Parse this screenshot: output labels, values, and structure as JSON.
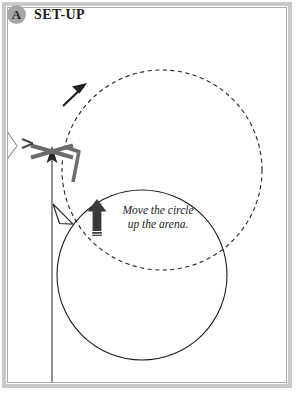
{
  "header": {
    "badge_label": "A",
    "title": "SET-UP"
  },
  "annotation": {
    "text": "Move the circle\nup the arena."
  },
  "colors": {
    "frame_outer": "#c9c9c9",
    "frame_inner": "#a9a9a9",
    "badge_fill": "#a6a6a6",
    "ink": "#1c1c1c",
    "jump_gray": "#6e6e6e",
    "arrow_dark": "#3a3a3a",
    "circle_line": "#1a1a1a",
    "background": "#ffffff"
  },
  "diagram": {
    "type": "arena-schooling-diagram",
    "elements": [
      {
        "name": "dashed-circle",
        "role": "target-circle-new-position",
        "style": "dashed",
        "center_x": 162,
        "center_y": 170,
        "radius": 100
      },
      {
        "name": "solid-circle",
        "role": "current-circle-position",
        "style": "solid",
        "center_x": 142,
        "center_y": 275,
        "radius": 85
      },
      {
        "name": "crossrail-jump",
        "role": "fence",
        "x": 52,
        "y": 151
      },
      {
        "name": "approach-line",
        "role": "track-line-to-fence",
        "from_x": 52,
        "from_y": 374,
        "to_x": 52,
        "to_y": 155
      },
      {
        "name": "direction-arrowhead-dashed",
        "role": "direction-of-travel",
        "x": 78,
        "y": 92,
        "heading": "up-right"
      },
      {
        "name": "direction-arrowhead-solid-circle",
        "role": "direction-of-travel",
        "x": 61,
        "y": 214,
        "heading": "up-left",
        "fill": "hollow"
      },
      {
        "name": "move-up-arrow",
        "role": "movement-instruction",
        "x": 97,
        "y": 216,
        "heading": "up",
        "fill": "solid"
      },
      {
        "name": "arena-gate-mark",
        "role": "arena-entrance",
        "x": 4,
        "y": 140
      }
    ],
    "labels": {
      "section": "SET-UP",
      "instruction": "Move the circle up the arena."
    }
  }
}
